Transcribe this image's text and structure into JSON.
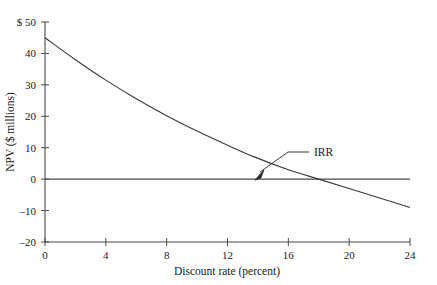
{
  "chart_data": {
    "type": "line",
    "title": "",
    "xlabel": "Discount rate (percent)",
    "ylabel": "NPV ($ millions)",
    "xlim": [
      0,
      24
    ],
    "ylim": [
      -20,
      50
    ],
    "xticks": [
      0,
      4,
      8,
      12,
      16,
      20,
      24
    ],
    "xtick_labels": [
      "0",
      "4",
      "8",
      "12",
      "16",
      "20",
      "24"
    ],
    "yticks": [
      -20,
      -10,
      0,
      10,
      20,
      30,
      40,
      50
    ],
    "ytick_labels": [
      "–20",
      "–10",
      "0",
      "10",
      "20",
      "30",
      "40",
      "$ 50"
    ],
    "grid": false,
    "legend": null,
    "zero_line": 0,
    "series": [
      {
        "name": "NPV profile",
        "x": [
          0,
          2,
          4,
          6,
          8,
          10,
          12,
          13.8,
          16,
          18,
          20,
          22,
          24
        ],
        "values": [
          45.0,
          38.0,
          31.5,
          25.6,
          20.2,
          15.3,
          10.8,
          7.0,
          3.0,
          0.0,
          -3.0,
          -6.0,
          -9.0
        ],
        "color": "#3a3a3a"
      }
    ],
    "annotations": [
      {
        "label": "IRR",
        "x": 13.8,
        "y": 0,
        "description": "arrow pointing to the point where the NPV curve crosses zero"
      }
    ]
  },
  "axis": {
    "y_label": "NPV ($ millions)",
    "x_label": "Discount rate (percent)"
  },
  "annotation": {
    "irr_label": "IRR"
  },
  "colors": {
    "curve": "#3a3a3a",
    "axis": "#4a4a4a",
    "text": "#1a1a1a"
  }
}
